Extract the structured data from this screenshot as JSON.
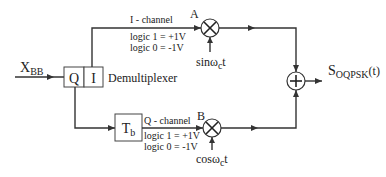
{
  "diagram": {
    "input": {
      "label": "X",
      "subscript": "BB"
    },
    "demux": {
      "label": "Demultiplexer",
      "q_label": "Q",
      "i_label": "I"
    },
    "i_channel": {
      "name": "I - channel",
      "logic1": "logic 1 = +1V",
      "logic0": "logic 0 = -1V",
      "node": "A",
      "carrier_prefix": "sinω",
      "carrier_sub": "c",
      "carrier_suffix": "t"
    },
    "q_channel": {
      "name": "Q - channel",
      "logic1": "logic 1 = +1V",
      "logic0": "logic 0 = -1V",
      "node": "B",
      "delay_label": "T",
      "delay_sub": "b",
      "carrier_prefix": "cosω",
      "carrier_sub": "c",
      "carrier_suffix": "t"
    },
    "summer": {
      "symbol": "+"
    },
    "output": {
      "label": "S",
      "subscript": "OQPSK",
      "suffix": "(t)"
    }
  }
}
